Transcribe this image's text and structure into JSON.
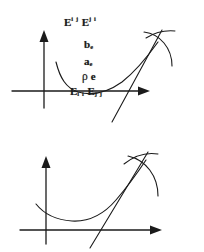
{
  "figure": {
    "kind": "two-panel-math-diagram",
    "background_color": "#ffffff",
    "ink_color": "#1b1b1b",
    "panels": [
      {
        "id": "top",
        "labels": {
          "upper_left_base": "E",
          "upper_left_sup": "i j",
          "upper_right_base": "E",
          "upper_right_sup": "j i",
          "b_base": "b",
          "b_sub": "e",
          "a_base": "a",
          "a_sub": "e",
          "rho_symbol": "ρ",
          "rho_sub": "e",
          "axis_left_base": "E",
          "axis_left_sub": "i i",
          "axis_right_base": "E",
          "axis_right_sub": "j j"
        }
      },
      {
        "id": "bottom",
        "labels": {
          "upper_left_base": "T",
          "upper_left_sub": "i j",
          "upper_right_base": "T",
          "upper_right_sub": "j i",
          "b_base": "b",
          "b_sub": "c",
          "a_base": "a",
          "a_sub": "c",
          "rho_symbol": "ρ",
          "rho_sub": "c",
          "axis_left_base": "T",
          "axis_left_sub": "i i",
          "axis_right_base": "T",
          "axis_right_sub": "j j"
        }
      }
    ]
  }
}
